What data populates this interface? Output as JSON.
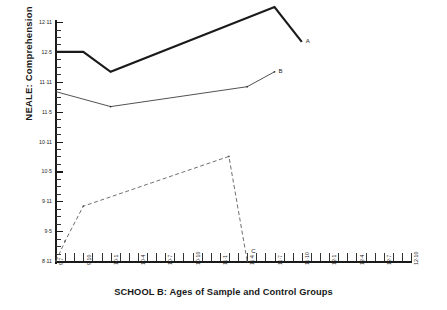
{
  "chart_data": {
    "type": "line",
    "title": "SCHOOL B: Ages of Sample and Control Groups",
    "xlabel": "SCHOOL B: Ages of Sample and Control Groups",
    "ylabel": "NEALE: Comprehension",
    "grid": false,
    "legend": "inline-end-labels",
    "x_tick_labels": [
      "9·7",
      "9·10",
      "10·1",
      "10·4",
      "10·7",
      "10·10",
      "11·1",
      "11·4",
      "11·7",
      "11·10",
      "12·1",
      "12·4",
      "12·7",
      "12·10"
    ],
    "x_tick_step_months": 3,
    "x_minor_step_months": 1,
    "xlim": [
      "9·7",
      "12·10"
    ],
    "y_tick_labels": [
      "8·11",
      "9·5",
      "9·11",
      "10·5",
      "10·11",
      "11·5",
      "11·11",
      "12·5",
      "12·11"
    ],
    "y_tick_step_months": 6,
    "y_minor_step_months": 1.5,
    "ylim": [
      "8·11",
      "12·11"
    ],
    "series": [
      {
        "name": "A",
        "label": "A",
        "style": "thick-solid",
        "color": "#1a1a1a",
        "points": [
          {
            "x": "9·7",
            "y": "12·5"
          },
          {
            "x": "9·10",
            "y": "12·5"
          },
          {
            "x": "10·1",
            "y": "12·1"
          },
          {
            "x": "11·7",
            "y": "13·2"
          },
          {
            "x": "11·10",
            "y": "12·7"
          }
        ]
      },
      {
        "name": "B",
        "label": "B",
        "style": "thin-solid",
        "color": "#333333",
        "points": [
          {
            "x": "9·7",
            "y": "11·9"
          },
          {
            "x": "10·1",
            "y": "11·6"
          },
          {
            "x": "11·4",
            "y": "11·10"
          },
          {
            "x": "11·7",
            "y": "12·1"
          }
        ]
      },
      {
        "name": "C",
        "label": "C",
        "style": "dashed",
        "color": "#555555",
        "points": [
          {
            "x": "9·7",
            "y": "8·11"
          },
          {
            "x": "9·8",
            "y": "9·3"
          },
          {
            "x": "9·10",
            "y": "9·10"
          },
          {
            "x": "11·2",
            "y": "10·8"
          },
          {
            "x": "11·4",
            "y": "8·11"
          }
        ]
      }
    ]
  },
  "axes": {
    "y_title": "NEALE: Comprehension",
    "x_title": "SCHOOL B: Ages of Sample and Control Groups"
  },
  "series_labels": {
    "a": "A",
    "b": "B",
    "c": "C"
  }
}
